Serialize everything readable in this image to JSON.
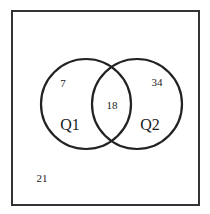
{
  "diagram": {
    "type": "venn",
    "sets": [
      {
        "name": "Q1",
        "only_count": "7"
      },
      {
        "name": "Q2",
        "only_count": "34"
      }
    ],
    "intersection_count": "18",
    "outside_count": "21",
    "colors": {
      "stroke": "#222222",
      "background": "#ffffff"
    }
  }
}
